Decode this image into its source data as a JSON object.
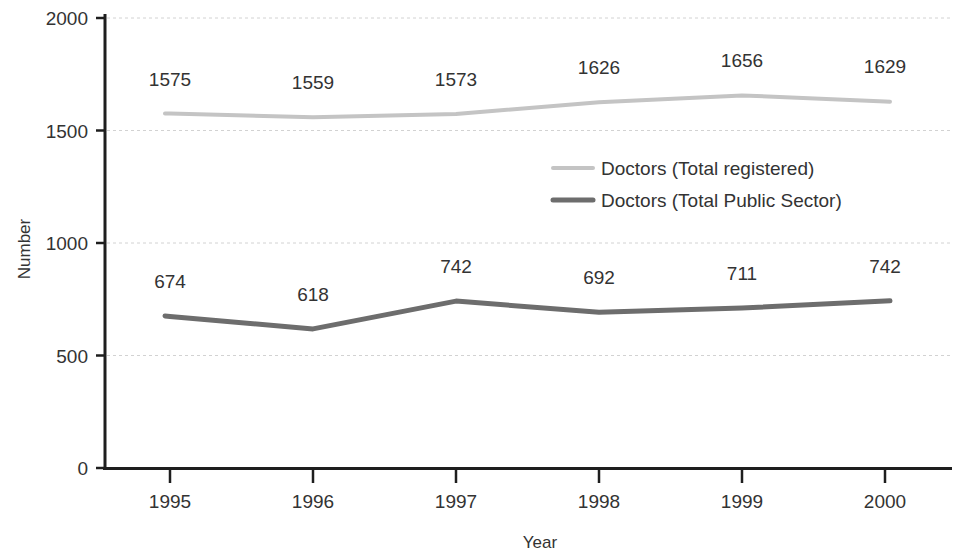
{
  "chart_data": {
    "type": "line",
    "title": "",
    "xlabel": "Year",
    "ylabel": "Number",
    "categories": [
      "1995",
      "1996",
      "1997",
      "1998",
      "1999",
      "2000"
    ],
    "x": [
      1995,
      1996,
      1997,
      1998,
      1999,
      2000
    ],
    "ylim": [
      0,
      2000
    ],
    "yticks": [
      0,
      500,
      1000,
      1500,
      2000
    ],
    "ytick_labels": [
      "0",
      "500",
      "1000",
      "1500",
      "2000"
    ],
    "grid": true,
    "grid_axis": "y",
    "legend_position": "center",
    "series": [
      {
        "name": "Doctors (Total registered)",
        "color": "#c4c4c4",
        "values": [
          1575,
          1559,
          1573,
          1626,
          1656,
          1629
        ],
        "labels": [
          "1575",
          "1559",
          "1573",
          "1626",
          "1656",
          "1629"
        ]
      },
      {
        "name": "Doctors (Total Public Sector)",
        "color": "#6d6d6d",
        "values": [
          674,
          618,
          742,
          692,
          711,
          742
        ],
        "labels": [
          "674",
          "618",
          "742",
          "692",
          "711",
          "742"
        ]
      }
    ]
  },
  "legend": {
    "entries": [
      {
        "label": "Doctors (Total registered)",
        "color": "#c4c4c4"
      },
      {
        "label": "Doctors (Total Public Sector)",
        "color": "#6d6d6d"
      }
    ]
  },
  "axes": {
    "y_title": "Number",
    "x_title": "Year"
  },
  "colors": {
    "axis": "#1e1e1e",
    "grid": "#d2d2d2",
    "text": "#333333",
    "background": "#ffffff"
  }
}
